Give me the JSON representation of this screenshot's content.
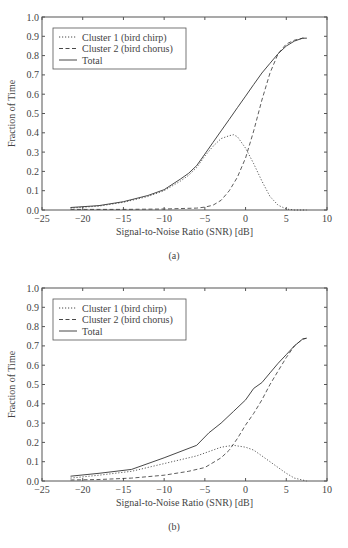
{
  "chart_data": [
    {
      "type": "line",
      "caption": "(a)",
      "title": "",
      "xlabel": "Signal-to-Noise Ratio (SNR) [dB]",
      "ylabel": "Fraction of Time",
      "xlim": [
        -25,
        10
      ],
      "ylim": [
        0,
        1.0
      ],
      "xticks": [
        "-25",
        "-20",
        "-15",
        "-10",
        "-5",
        "0",
        "5",
        "10"
      ],
      "yticks": [
        "0.0",
        "0.1",
        "0.2",
        "0.3",
        "0.4",
        "0.5",
        "0.6",
        "0.7",
        "0.8",
        "0.9",
        "1.0"
      ],
      "grid": false,
      "legend_position": "upper left",
      "series": [
        {
          "name": "Cluster 1 (bird chirp)",
          "style": "dotted",
          "x": [
            -21.5,
            -18,
            -15,
            -12,
            -10,
            -8,
            -7,
            -6,
            -5,
            -4,
            -3,
            -2,
            -1.5,
            -1,
            0,
            1,
            2,
            3,
            4,
            5,
            6,
            7.5
          ],
          "y": [
            0.01,
            0.02,
            0.04,
            0.07,
            0.1,
            0.15,
            0.18,
            0.22,
            0.28,
            0.33,
            0.37,
            0.385,
            0.39,
            0.38,
            0.32,
            0.24,
            0.15,
            0.07,
            0.025,
            0.005,
            0.0,
            0.0
          ]
        },
        {
          "name": "Cluster 2 (bird chorus)",
          "style": "dashed",
          "x": [
            -21.5,
            -18,
            -15,
            -10,
            -6,
            -5,
            -4,
            -3,
            -2,
            -1,
            0,
            1,
            2,
            3,
            4,
            5,
            6,
            7,
            7.5
          ],
          "y": [
            0.003,
            0.003,
            0.003,
            0.005,
            0.01,
            0.015,
            0.025,
            0.05,
            0.1,
            0.17,
            0.27,
            0.41,
            0.57,
            0.71,
            0.81,
            0.86,
            0.88,
            0.89,
            0.89
          ]
        },
        {
          "name": "Total",
          "style": "solid",
          "x": [
            -21.5,
            -18,
            -15,
            -12,
            -10,
            -8,
            -7,
            -6,
            -5,
            -4,
            -3,
            -2,
            -1,
            0,
            1,
            2,
            3,
            4,
            5,
            6,
            7,
            7.5
          ],
          "y": [
            0.013,
            0.023,
            0.043,
            0.075,
            0.105,
            0.16,
            0.19,
            0.23,
            0.29,
            0.35,
            0.41,
            0.47,
            0.53,
            0.59,
            0.65,
            0.71,
            0.76,
            0.81,
            0.85,
            0.875,
            0.89,
            0.89
          ]
        }
      ]
    },
    {
      "type": "line",
      "caption": "(b)",
      "title": "",
      "xlabel": "Signal-to-Noise Ratio (SNR) [dB]",
      "ylabel": "Fraction of Time",
      "xlim": [
        -25,
        10
      ],
      "ylim": [
        0,
        1.0
      ],
      "xticks": [
        "-25",
        "-20",
        "-15",
        "-10",
        "-5",
        "0",
        "5",
        "10"
      ],
      "yticks": [
        "0.0",
        "0.1",
        "0.2",
        "0.3",
        "0.4",
        "0.5",
        "0.6",
        "0.7",
        "0.8",
        "0.9",
        "1.0"
      ],
      "grid": false,
      "legend_position": "upper left",
      "series": [
        {
          "name": "Cluster 1 (bird chirp)",
          "style": "dotted",
          "x": [
            -21.5,
            -18,
            -14,
            -10,
            -6,
            -4,
            -3,
            -1.5,
            0,
            1,
            2,
            3,
            4,
            5,
            6,
            7,
            7.5
          ],
          "y": [
            0.015,
            0.03,
            0.05,
            0.09,
            0.13,
            0.16,
            0.175,
            0.185,
            0.175,
            0.16,
            0.13,
            0.1,
            0.07,
            0.04,
            0.015,
            0.005,
            0.0
          ]
        },
        {
          "name": "Cluster 2 (bird chorus)",
          "style": "dashed",
          "x": [
            -21.5,
            -18,
            -14,
            -10,
            -7,
            -5,
            -3,
            -2,
            -1,
            0,
            1,
            2,
            3,
            4,
            5,
            6,
            7,
            7.5
          ],
          "y": [
            0.005,
            0.008,
            0.015,
            0.03,
            0.05,
            0.07,
            0.12,
            0.16,
            0.22,
            0.29,
            0.35,
            0.42,
            0.5,
            0.57,
            0.64,
            0.7,
            0.735,
            0.74
          ]
        },
        {
          "name": "Total",
          "style": "solid",
          "x": [
            -21.5,
            -18,
            -14,
            -10,
            -6,
            -4.5,
            -3,
            -1.5,
            0,
            1,
            2,
            3,
            4,
            5,
            6,
            7,
            7.5
          ],
          "y": [
            0.025,
            0.04,
            0.06,
            0.12,
            0.185,
            0.25,
            0.3,
            0.36,
            0.42,
            0.48,
            0.51,
            0.56,
            0.61,
            0.655,
            0.7,
            0.735,
            0.74
          ]
        }
      ]
    }
  ]
}
